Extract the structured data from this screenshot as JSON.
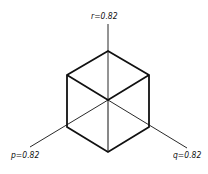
{
  "diagram": {
    "axes": [
      {
        "name": "r",
        "label": "r=0.82",
        "direction": "vertical-up"
      },
      {
        "name": "p",
        "label": "p=0.82",
        "direction": "down-left"
      },
      {
        "name": "q",
        "label": "q=0.82",
        "direction": "down-right"
      }
    ],
    "colors": {
      "line": "#111111",
      "background": "#ffffff"
    }
  }
}
